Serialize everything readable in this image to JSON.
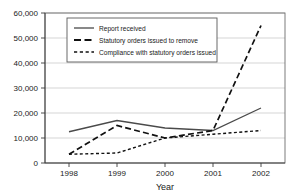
{
  "chart_data": {
    "type": "line",
    "title": "",
    "xlabel": "Year",
    "ylabel": "",
    "categories": [
      "1998",
      "1999",
      "2000",
      "2001",
      "2002"
    ],
    "x": [
      1998,
      1999,
      2000,
      2001,
      2002
    ],
    "ylim": [
      0,
      60000
    ],
    "ytick_labels": [
      "0",
      "10,000",
      "20,000",
      "30,000",
      "40,000",
      "50,000",
      "60,000"
    ],
    "ytick_values": [
      0,
      10000,
      20000,
      30000,
      40000,
      50000,
      60000
    ],
    "grid": true,
    "legend_position": "top-left-inside",
    "series": [
      {
        "name": "Report received",
        "style": "solid",
        "values": [
          12500,
          17000,
          14000,
          13000,
          22000
        ]
      },
      {
        "name": "Statutory orders issued to remove",
        "style": "long-dashed",
        "values": [
          3500,
          15000,
          10000,
          13000,
          55000
        ]
      },
      {
        "name": "Compliance with statutory orders issued",
        "style": "short-dashed",
        "values": [
          3500,
          4000,
          10000,
          11500,
          13000
        ]
      }
    ]
  },
  "axes": {
    "x_title": "Year",
    "x_tick_labels": [
      "1998",
      "1999",
      "2000",
      "2001",
      "2002"
    ],
    "y_tick_labels": [
      "60,000",
      "50,000",
      "40,000",
      "30,000",
      "20,000",
      "10,000",
      "0"
    ]
  },
  "legend": {
    "entries": [
      {
        "label": "Report received",
        "style": "solid"
      },
      {
        "label": "Statutory orders issued to remove",
        "style": "long-dashed"
      },
      {
        "label": "Compliance with statutory orders issued",
        "style": "short-dashed"
      }
    ]
  },
  "colors": {
    "background": "#ffffff",
    "grid": "#b8b8b8",
    "frame": "#6e6e6e",
    "axis": "#3a3a3a",
    "series_solid": "#4a4a4a",
    "series_dashed": "#111111",
    "series_dotted": "#111111",
    "text": "#1a1a1a"
  }
}
